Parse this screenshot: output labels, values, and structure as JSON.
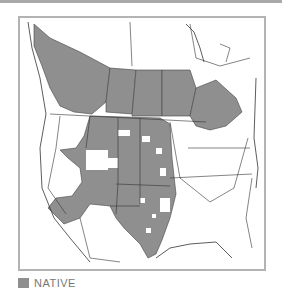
{
  "map": {
    "subject": "Native range distribution map of North America",
    "regions_shaded": [
      "British Columbia",
      "Alberta",
      "Saskatchewan",
      "Manitoba",
      "Ontario (southern)",
      "Montana",
      "Wyoming",
      "North Dakota",
      "South Dakota",
      "Nebraska",
      "Kansas",
      "Colorado",
      "Oklahoma",
      "Texas",
      "New Mexico",
      "Arizona",
      "Utah (partial)",
      "Nevada (partial)",
      "California (southern)",
      "Idaho (partial)"
    ],
    "colors": {
      "native": "#8f8f8f",
      "land": "#ffffff",
      "border": "#333333",
      "frame": "#b3b3b3"
    }
  },
  "legend": {
    "items": [
      {
        "label": "NATIVE",
        "color": "#8f8f8f"
      }
    ]
  }
}
